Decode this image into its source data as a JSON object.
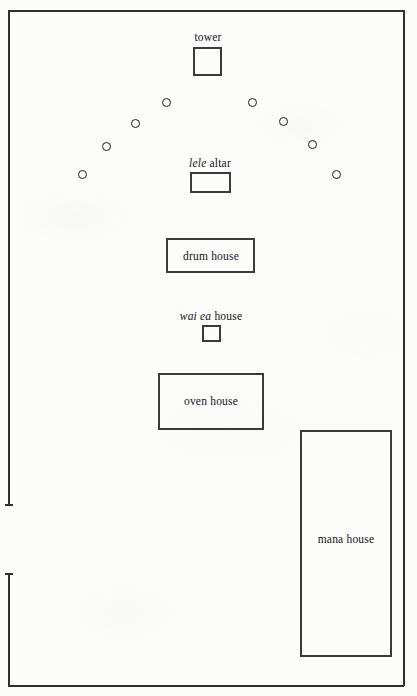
{
  "figure": {
    "type": "architectural-plan",
    "background_color": "#fcfcfb",
    "ink_color": "#2f2f2f",
    "canvas": {
      "width": 417,
      "height": 696
    }
  },
  "enclosure": {
    "name": "enclosure-wall",
    "bounds": {
      "left": 8,
      "top": 10,
      "right": 404,
      "bottom": 686
    },
    "stroke_width": 2,
    "segments": [
      {
        "id": "north-wall",
        "orientation": "horizontal",
        "x": 8,
        "y": 10,
        "length": 396
      },
      {
        "id": "east-wall",
        "orientation": "vertical",
        "x": 403,
        "y": 10,
        "length": 676
      },
      {
        "id": "south-wall",
        "orientation": "horizontal",
        "x": 8,
        "y": 685,
        "length": 396
      },
      {
        "id": "west-wall-upper",
        "orientation": "vertical",
        "x": 8,
        "y": 10,
        "length": 496
      },
      {
        "id": "west-wall-lower",
        "orientation": "vertical",
        "x": 8,
        "y": 573,
        "length": 113
      }
    ],
    "gap": {
      "id": "west-wall-entrance",
      "x": 8,
      "top": 506,
      "bottom": 572
    }
  },
  "structures": [
    {
      "id": "tower",
      "label": "tower",
      "label_plain": "tower",
      "label_italic_part": "",
      "label_position": "above",
      "x": 193,
      "y": 47,
      "width": 29,
      "height": 29
    },
    {
      "id": "lele-altar",
      "label": "lele altar",
      "label_italic_part": "lele",
      "label_rest": " altar",
      "label_position": "above",
      "x": 190,
      "y": 172,
      "width": 41,
      "height": 21
    },
    {
      "id": "drum-house",
      "label": "drum house",
      "label_italic_part": "",
      "label_position": "inside",
      "x": 166,
      "y": 238,
      "width": 89,
      "height": 35
    },
    {
      "id": "wai-ea-house",
      "label": "wai ea house",
      "label_italic_part": "wai ea",
      "label_rest": " house",
      "label_position": "above",
      "x": 202,
      "y": 325,
      "width": 19,
      "height": 17
    },
    {
      "id": "oven-house",
      "label": "oven house",
      "label_italic_part": "",
      "label_position": "inside",
      "x": 158,
      "y": 373,
      "width": 106,
      "height": 57
    },
    {
      "id": "mana-house",
      "label": "mana house",
      "label_italic_part": "",
      "label_position": "inside",
      "x": 300,
      "y": 430,
      "width": 92,
      "height": 227
    }
  ],
  "post_circles": {
    "id": "image-posts-arc",
    "description": "arc of carved image posts",
    "count": 8,
    "diameter": 9,
    "positions": [
      {
        "cx": 82,
        "cy": 174
      },
      {
        "cx": 106,
        "cy": 146
      },
      {
        "cx": 135,
        "cy": 123
      },
      {
        "cx": 166,
        "cy": 102
      },
      {
        "cx": 252,
        "cy": 102
      },
      {
        "cx": 283,
        "cy": 121
      },
      {
        "cx": 312,
        "cy": 144
      },
      {
        "cx": 336,
        "cy": 174
      }
    ]
  }
}
